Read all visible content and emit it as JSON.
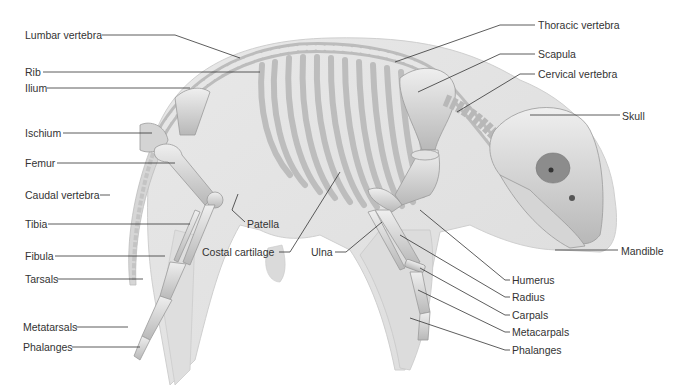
{
  "diagram": {
    "colors": {
      "body_silhouette": "#e3e3e3",
      "body_outline": "#cfcfcf",
      "bone": "#c9c9c9",
      "bone_highlight": "#ececec",
      "bone_shadow": "#9a9a9a",
      "leader_line": "#333333",
      "label_text": "#333333"
    },
    "labels_left": [
      {
        "id": "lumbar-vertebra",
        "text": "Lumbar vertebra"
      },
      {
        "id": "rib",
        "text": "Rib"
      },
      {
        "id": "ilium",
        "text": "Ilium"
      },
      {
        "id": "ischium",
        "text": "Ischium"
      },
      {
        "id": "femur",
        "text": "Femur"
      },
      {
        "id": "caudal-vertebra",
        "text": "Caudal vertebra"
      },
      {
        "id": "tibia",
        "text": "Tibia"
      },
      {
        "id": "fibula",
        "text": "Fibula"
      },
      {
        "id": "tarsals",
        "text": "Tarsals"
      },
      {
        "id": "metatarsals",
        "text": "Metatarsals"
      },
      {
        "id": "phalanges-hind",
        "text": "Phalanges"
      }
    ],
    "labels_center": [
      {
        "id": "patella",
        "text": "Patella"
      },
      {
        "id": "costal-cartilage",
        "text": "Costal cartilage"
      },
      {
        "id": "ulna",
        "text": "Ulna"
      }
    ],
    "labels_right": [
      {
        "id": "thoracic-vertebra",
        "text": "Thoracic vertebra"
      },
      {
        "id": "scapula",
        "text": "Scapula"
      },
      {
        "id": "cervical-vertebra",
        "text": "Cervical vertebra"
      },
      {
        "id": "skull",
        "text": "Skull"
      },
      {
        "id": "mandible",
        "text": "Mandible"
      },
      {
        "id": "humerus",
        "text": "Humerus"
      },
      {
        "id": "radius",
        "text": "Radius"
      },
      {
        "id": "carpals",
        "text": "Carpals"
      },
      {
        "id": "metacarpals",
        "text": "Metacarpals"
      },
      {
        "id": "phalanges-fore",
        "text": "Phalanges"
      }
    ]
  }
}
